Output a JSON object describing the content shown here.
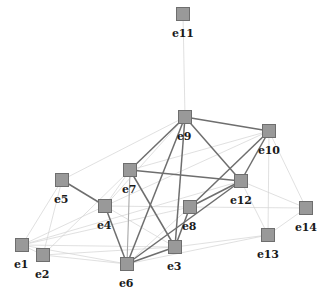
{
  "graph": {
    "title": "",
    "type": "node-link-network",
    "node_style": {
      "shape": "square",
      "fill": "#999999",
      "stroke": "#6e6e6e",
      "size": 14
    },
    "label_color": "#1a1a1a",
    "edge_colors": {
      "strong": "#6e6e6e",
      "medium": "#a8a8a8",
      "weak": "#d2d2d2"
    },
    "nodes": [
      {
        "id": "e1",
        "label": "e1",
        "x": 22,
        "y": 245,
        "label_dx": -8,
        "label_dy": 14
      },
      {
        "id": "e2",
        "label": "e2",
        "x": 43,
        "y": 255,
        "label_dx": -8,
        "label_dy": 14
      },
      {
        "id": "e3",
        "label": "e3",
        "x": 175,
        "y": 247,
        "label_dx": -8,
        "label_dy": 14
      },
      {
        "id": "e4",
        "label": "e4",
        "x": 105,
        "y": 206,
        "label_dx": -8,
        "label_dy": 14
      },
      {
        "id": "e5",
        "label": "e5",
        "x": 62,
        "y": 180,
        "label_dx": -8,
        "label_dy": 14
      },
      {
        "id": "e6",
        "label": "e6",
        "x": 127,
        "y": 264,
        "label_dx": -8,
        "label_dy": 14
      },
      {
        "id": "e7",
        "label": "e7",
        "x": 130,
        "y": 170,
        "label_dx": -8,
        "label_dy": 14
      },
      {
        "id": "e8",
        "label": "e8",
        "x": 190,
        "y": 207,
        "label_dx": -8,
        "label_dy": 14
      },
      {
        "id": "e9",
        "label": "e9",
        "x": 185,
        "y": 117,
        "label_dx": -8,
        "label_dy": 14
      },
      {
        "id": "e10",
        "label": "e10",
        "x": 269,
        "y": 131,
        "label_dx": -11,
        "label_dy": 14
      },
      {
        "id": "e11",
        "label": "e11",
        "x": 183,
        "y": 14,
        "label_dx": -11,
        "label_dy": 14
      },
      {
        "id": "e12",
        "label": "e12",
        "x": 241,
        "y": 181,
        "label_dx": -11,
        "label_dy": 14
      },
      {
        "id": "e13",
        "label": "e13",
        "x": 268,
        "y": 235,
        "label_dx": -11,
        "label_dy": 14
      },
      {
        "id": "e14",
        "label": "e14",
        "x": 306,
        "y": 208,
        "label_dx": -11,
        "label_dy": 14
      }
    ],
    "edges": [
      {
        "source": "e11",
        "target": "e9",
        "weight": "weak"
      },
      {
        "source": "e9",
        "target": "e10",
        "weight": "strong"
      },
      {
        "source": "e9",
        "target": "e7",
        "weight": "strong"
      },
      {
        "source": "e9",
        "target": "e12",
        "weight": "strong"
      },
      {
        "source": "e9",
        "target": "e6",
        "weight": "strong"
      },
      {
        "source": "e9",
        "target": "e3",
        "weight": "strong"
      },
      {
        "source": "e9",
        "target": "e5",
        "weight": "weak"
      },
      {
        "source": "e9",
        "target": "e4",
        "weight": "weak"
      },
      {
        "source": "e10",
        "target": "e12",
        "weight": "strong"
      },
      {
        "source": "e10",
        "target": "e8",
        "weight": "strong"
      },
      {
        "source": "e10",
        "target": "e7",
        "weight": "weak"
      },
      {
        "source": "e10",
        "target": "e14",
        "weight": "weak"
      },
      {
        "source": "e10",
        "target": "e13",
        "weight": "weak"
      },
      {
        "source": "e10",
        "target": "e4",
        "weight": "weak"
      },
      {
        "source": "e12",
        "target": "e7",
        "weight": "strong"
      },
      {
        "source": "e12",
        "target": "e8",
        "weight": "strong"
      },
      {
        "source": "e12",
        "target": "e6",
        "weight": "strong"
      },
      {
        "source": "e12",
        "target": "e13",
        "weight": "weak"
      },
      {
        "source": "e12",
        "target": "e14",
        "weight": "weak"
      },
      {
        "source": "e12",
        "target": "e1",
        "weight": "weak"
      },
      {
        "source": "e8",
        "target": "e3",
        "weight": "strong"
      },
      {
        "source": "e8",
        "target": "e6",
        "weight": "weak"
      },
      {
        "source": "e8",
        "target": "e4",
        "weight": "weak"
      },
      {
        "source": "e8",
        "target": "e1",
        "weight": "weak"
      },
      {
        "source": "e7",
        "target": "e6",
        "weight": "medium"
      },
      {
        "source": "e7",
        "target": "e3",
        "weight": "strong"
      },
      {
        "source": "e7",
        "target": "e4",
        "weight": "weak"
      },
      {
        "source": "e7",
        "target": "e2",
        "weight": "weak"
      },
      {
        "source": "e5",
        "target": "e4",
        "weight": "strong"
      },
      {
        "source": "e5",
        "target": "e1",
        "weight": "weak"
      },
      {
        "source": "e5",
        "target": "e2",
        "weight": "weak"
      },
      {
        "source": "e4",
        "target": "e6",
        "weight": "strong"
      },
      {
        "source": "e4",
        "target": "e3",
        "weight": "weak"
      },
      {
        "source": "e4",
        "target": "e1",
        "weight": "weak"
      },
      {
        "source": "e6",
        "target": "e3",
        "weight": "strong"
      },
      {
        "source": "e6",
        "target": "e1",
        "weight": "weak"
      },
      {
        "source": "e6",
        "target": "e2",
        "weight": "weak"
      },
      {
        "source": "e3",
        "target": "e1",
        "weight": "weak"
      },
      {
        "source": "e3",
        "target": "e2",
        "weight": "weak"
      },
      {
        "source": "e3",
        "target": "e13",
        "weight": "weak"
      },
      {
        "source": "e1",
        "target": "e2",
        "weight": "weak"
      },
      {
        "source": "e13",
        "target": "e14",
        "weight": "weak"
      },
      {
        "source": "e14",
        "target": "e8",
        "weight": "weak"
      },
      {
        "source": "e13",
        "target": "e6",
        "weight": "weak"
      }
    ]
  }
}
